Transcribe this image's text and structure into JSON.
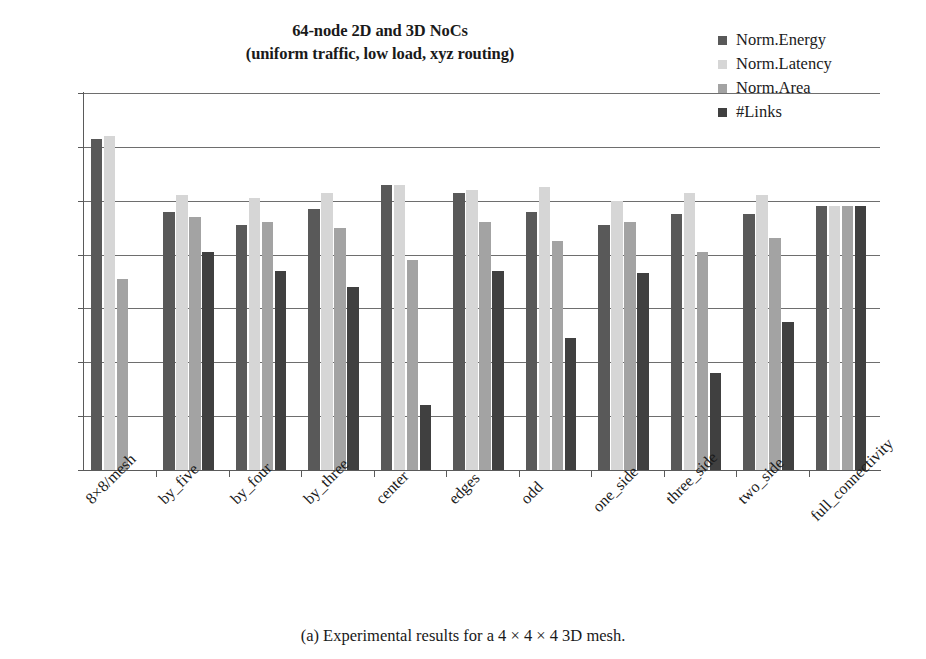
{
  "chart_data": {
    "type": "bar",
    "title": "64-node 2D and 3D NoCs",
    "subtitle": "(uniform traffic, low load, xyz routing)",
    "xlabel": "",
    "ylabel": "",
    "ylim": [
      0,
      140
    ],
    "ytick_labels": [
      "140%",
      "120%",
      "100%",
      "80%",
      "60%",
      "40%",
      "20%",
      "0%"
    ],
    "ytick_values": [
      140,
      120,
      100,
      80,
      60,
      40,
      20,
      0
    ],
    "grid": "horizontal",
    "legend_position": "top-right",
    "categories": [
      "8×8/mesh",
      "by_five",
      "by_four",
      "by_three",
      "center",
      "edges",
      "odd",
      "one_side",
      "three_side",
      "two_side",
      "full_connectivity"
    ],
    "series": [
      {
        "name": "Norm.Energy",
        "color": "#595959",
        "values": [
          123,
          96,
          91,
          97,
          106,
          103,
          96,
          91,
          95,
          95,
          98
        ]
      },
      {
        "name": "Norm.Latency",
        "color": "#d6d6d6",
        "values": [
          124,
          102,
          101,
          103,
          106,
          104,
          105,
          100,
          103,
          102,
          98
        ]
      },
      {
        "name": "Norm.Area",
        "color": "#a3a3a3",
        "values": [
          71,
          94,
          92,
          90,
          78,
          92,
          85,
          92,
          81,
          86,
          98
        ]
      },
      {
        "name": "#Links",
        "color": "#404040",
        "values": [
          null,
          81,
          74,
          68,
          24,
          74,
          49,
          73,
          36,
          55,
          98
        ]
      }
    ]
  },
  "caption": "(a) Experimental results for a 4 × 4 × 4 3D mesh."
}
